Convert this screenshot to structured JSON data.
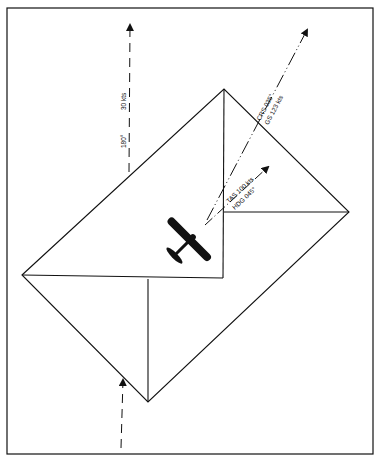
{
  "diagram": {
    "wind": {
      "direction": "180°",
      "speed": "30 kts"
    },
    "course": {
      "course": "CRS 035°",
      "groundspeed": "GS 123 kts"
    },
    "heading": {
      "tas": "TAS 100 kts",
      "heading": "HDG 045°"
    },
    "colors": {
      "line": "#111111",
      "background": "#ffffff"
    }
  }
}
